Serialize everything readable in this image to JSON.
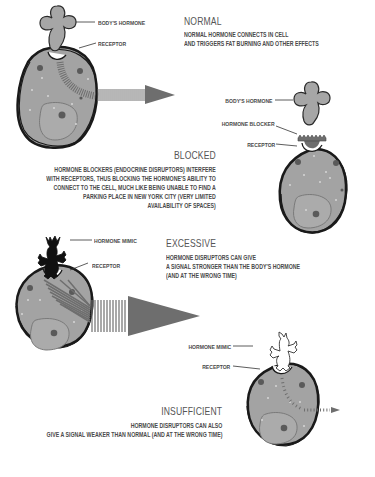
{
  "sections": {
    "normal": {
      "title": "NORMAL",
      "description": [
        "NORMAL HORMONE CONNECTS IN CELL",
        "AND TRIGGERS FAT BURNING AND OTHER EFFECTS"
      ],
      "labels": {
        "hormone": "BODY'S HORMONE",
        "receptor": "RECEPTOR"
      }
    },
    "blocked": {
      "title": "BLOCKED",
      "description": [
        "HORMONE BLOCKERS (ENDOCRINE DISRUPTORS) INTERFERE",
        "WITH RECEPTORS, THUS BLOCKING THE HORMONE'S ABILITY TO",
        "CONNECT TO THE CELL, MUCH LIKE BEING UNABLE TO FIND A",
        "PARKING PLACE IN NEW YORK CITY (VERY LIMITED",
        "AVAILABILITY OF SPACES)"
      ],
      "labels": {
        "hormone": "BODY'S HORMONE",
        "blocker": "HORMONE BLOCKER",
        "receptor": "RECEPTOR"
      }
    },
    "excessive": {
      "title": "EXCESSIVE",
      "description": [
        "HORMONE DISRUPTORS CAN GIVE",
        "A SIGNAL STRONGER THAN THE BODY'S HORMONE",
        "(AND AT THE WRONG TIME)"
      ],
      "labels": {
        "mimic": "HORMONE MIMIC",
        "receptor": "RECEPTOR"
      }
    },
    "insufficient": {
      "title": "INSUFFICIENT",
      "description": [
        "HORMONE DISRUPTORS CAN ALSO",
        "GIVE A SIGNAL WEAKER THAN NORMAL (AND AT THE WRONG TIME)"
      ],
      "labels": {
        "mimic": "HORMONE MIMIC",
        "receptor": "RECEPTOR"
      }
    }
  },
  "colors": {
    "cell_fill": "#a3a3a3",
    "nucleus_fill": "#ababab",
    "outline": "#1a1a1a",
    "hormone_fill": "#a6a6a6",
    "blocker_fill": "#6e6e6e",
    "mimic_fill": "#111111",
    "signal": "#707070",
    "text": "#4a4a4a"
  }
}
